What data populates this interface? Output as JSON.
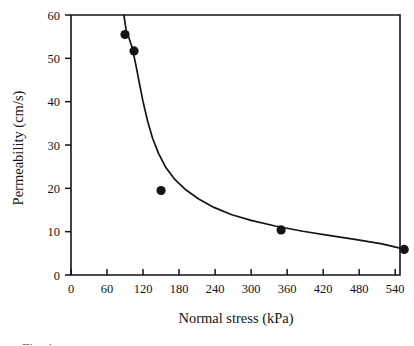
{
  "chart_data": {
    "type": "scatter",
    "title": "",
    "xlabel": "Normal stress (kPa)",
    "ylabel": "Permeability (cm/s)",
    "xlim": [
      0,
      548
    ],
    "ylim": [
      0,
      60
    ],
    "grid": false,
    "legend": "none",
    "xticks": [
      0,
      60,
      120,
      180,
      240,
      300,
      360,
      420,
      480,
      540
    ],
    "xtick_labels": [
      "0",
      "60",
      "120",
      "180",
      "240",
      "300",
      "360",
      "420",
      "480",
      "540"
    ],
    "yticks": [
      0,
      10,
      20,
      30,
      40,
      50,
      60
    ],
    "ytick_labels": [
      "0",
      "10",
      "20",
      "30",
      "40",
      "50",
      "60"
    ],
    "series": [
      {
        "name": "Measured permeability",
        "marker": "filled-circle",
        "color": "#141414",
        "points": [
          {
            "x": 90,
            "y": 55.5
          },
          {
            "x": 105,
            "y": 51.7
          },
          {
            "x": 150,
            "y": 19.5
          },
          {
            "x": 350,
            "y": 10.4
          },
          {
            "x": 555,
            "y": 5.9
          }
        ]
      },
      {
        "name": "Fitted decay curve",
        "marker": "none",
        "color": "#141414",
        "points": [
          {
            "x": 88,
            "y": 60.0
          },
          {
            "x": 92,
            "y": 56.4
          },
          {
            "x": 97,
            "y": 54.5
          },
          {
            "x": 102,
            "y": 52.4
          },
          {
            "x": 108,
            "y": 48.5
          },
          {
            "x": 114,
            "y": 44.2
          },
          {
            "x": 120,
            "y": 40.0
          },
          {
            "x": 128,
            "y": 35.3
          },
          {
            "x": 136,
            "y": 31.5
          },
          {
            "x": 146,
            "y": 28.0
          },
          {
            "x": 158,
            "y": 24.8
          },
          {
            "x": 172,
            "y": 22.2
          },
          {
            "x": 190,
            "y": 19.8
          },
          {
            "x": 212,
            "y": 17.6
          },
          {
            "x": 238,
            "y": 15.6
          },
          {
            "x": 268,
            "y": 13.9
          },
          {
            "x": 300,
            "y": 12.6
          },
          {
            "x": 340,
            "y": 11.3
          },
          {
            "x": 386,
            "y": 10.1
          },
          {
            "x": 432,
            "y": 9.1
          },
          {
            "x": 478,
            "y": 8.1
          },
          {
            "x": 518,
            "y": 7.2
          },
          {
            "x": 548,
            "y": 6.2
          }
        ]
      }
    ]
  },
  "caption": {
    "partial_text": "Fig. 4 ..."
  }
}
